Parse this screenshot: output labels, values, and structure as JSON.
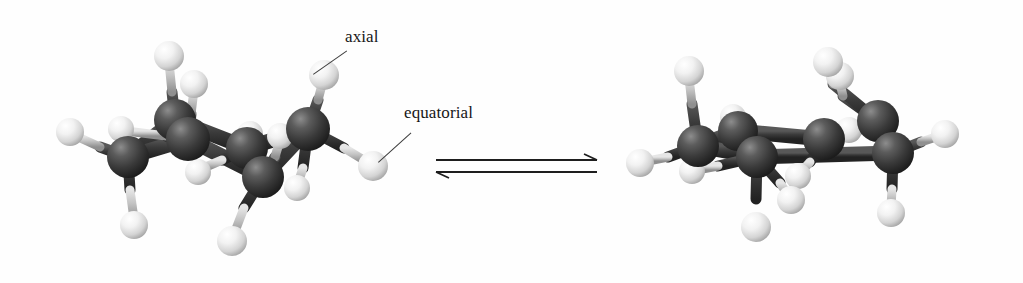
{
  "figure": {
    "background_color": "#fefefe",
    "width": 1023,
    "height": 283,
    "style": "grayscale ball-and-stick photographic model"
  },
  "labels": {
    "axial": "axial",
    "equatorial": "equatorial"
  },
  "equilibrium": {
    "name": "equilibrium-arrows",
    "forward_direction": "right",
    "reverse_direction": "left",
    "arrow_color": "#1e1e1e"
  },
  "colors": {
    "carbon_sphere": "#3c3c3c",
    "carbon_sphere_highlight": "#7d7d7d",
    "carbon_sphere_shadow": "#1c1c1c",
    "hydrogen_sphere": "#eeeeee",
    "hydrogen_sphere_highlight": "#ffffff",
    "hydrogen_sphere_shadow": "#9a9a9a",
    "bond_dark": "#3a3a3a",
    "bond_light": "#c9c9c9",
    "label_text": "#161616",
    "leader_line": "#3c3c3c",
    "background": "#fefefe"
  },
  "molecules": [
    {
      "id": "left-chair",
      "name": "cyclohexane-chair-left",
      "formula": "C6H12",
      "carbon_count": 6,
      "hydrogen_count": 12,
      "conformation": "chair",
      "carbons": [
        {
          "id": "C1",
          "x": 128,
          "y": 157,
          "r": 21
        },
        {
          "id": "C2",
          "x": 188,
          "y": 139,
          "r": 22
        },
        {
          "id": "C3",
          "x": 175,
          "y": 120,
          "r": 21
        },
        {
          "id": "C4",
          "x": 247,
          "y": 148,
          "r": 21
        },
        {
          "id": "C5",
          "x": 308,
          "y": 129,
          "r": 22
        },
        {
          "id": "C6",
          "x": 263,
          "y": 177,
          "r": 21
        }
      ],
      "hydrogens": [
        {
          "id": "H1",
          "x": 169,
          "y": 56,
          "r": 15,
          "type": "axial"
        },
        {
          "id": "H2",
          "x": 194,
          "y": 84,
          "r": 14,
          "type": "axial"
        },
        {
          "id": "H3",
          "x": 324,
          "y": 75,
          "r": 15,
          "type": "axial",
          "labeled": "axial"
        },
        {
          "id": "H4",
          "x": 70,
          "y": 132,
          "r": 14,
          "type": "equatorial"
        },
        {
          "id": "H5",
          "x": 121,
          "y": 129,
          "r": 13,
          "type": "equatorial"
        },
        {
          "id": "H6",
          "x": 250,
          "y": 134,
          "r": 13,
          "type": "equatorial"
        },
        {
          "id": "H7",
          "x": 280,
          "y": 136,
          "r": 13,
          "type": "equatorial"
        },
        {
          "id": "H8",
          "x": 373,
          "y": 166,
          "r": 15,
          "type": "equatorial",
          "labeled": "equatorial"
        },
        {
          "id": "H9",
          "x": 134,
          "y": 225,
          "r": 14,
          "type": "axial"
        },
        {
          "id": "H10",
          "x": 198,
          "y": 172,
          "r": 13,
          "type": "equatorial"
        },
        {
          "id": "H11",
          "x": 232,
          "y": 241,
          "r": 15,
          "type": "axial"
        },
        {
          "id": "H12",
          "x": 297,
          "y": 188,
          "r": 13,
          "type": "equatorial"
        }
      ]
    },
    {
      "id": "right-chair",
      "name": "cyclohexane-chair-right",
      "formula": "C6H12",
      "carbon_count": 6,
      "hydrogen_count": 12,
      "conformation": "chair (ring-flipped)",
      "carbons": [
        {
          "id": "C1",
          "x": 698,
          "y": 146,
          "r": 21
        },
        {
          "id": "C2",
          "x": 757,
          "y": 157,
          "r": 21
        },
        {
          "id": "C3",
          "x": 738,
          "y": 131,
          "r": 20
        },
        {
          "id": "C4",
          "x": 824,
          "y": 139,
          "r": 21
        },
        {
          "id": "C5",
          "x": 878,
          "y": 121,
          "r": 21
        },
        {
          "id": "C6",
          "x": 893,
          "y": 153,
          "r": 21
        }
      ],
      "hydrogens": [
        {
          "id": "H1",
          "x": 689,
          "y": 71,
          "r": 15,
          "type": "axial"
        },
        {
          "id": "H2",
          "x": 840,
          "y": 76,
          "r": 14,
          "type": "axial"
        },
        {
          "id": "H3",
          "x": 828,
          "y": 62,
          "r": 15,
          "type": "axial"
        },
        {
          "id": "H4",
          "x": 733,
          "y": 117,
          "r": 13,
          "type": "equatorial"
        },
        {
          "id": "H5",
          "x": 640,
          "y": 163,
          "r": 14,
          "type": "equatorial"
        },
        {
          "id": "H6",
          "x": 692,
          "y": 171,
          "r": 13,
          "type": "equatorial"
        },
        {
          "id": "H7",
          "x": 849,
          "y": 130,
          "r": 13,
          "type": "equatorial"
        },
        {
          "id": "H8",
          "x": 945,
          "y": 134,
          "r": 14,
          "type": "equatorial"
        },
        {
          "id": "H9",
          "x": 756,
          "y": 227,
          "r": 15,
          "type": "axial"
        },
        {
          "id": "H10",
          "x": 798,
          "y": 176,
          "r": 13,
          "type": "equatorial"
        },
        {
          "id": "H11",
          "x": 791,
          "y": 200,
          "r": 14,
          "type": "axial"
        },
        {
          "id": "H12",
          "x": 891,
          "y": 213,
          "r": 14,
          "type": "axial"
        }
      ]
    }
  ]
}
